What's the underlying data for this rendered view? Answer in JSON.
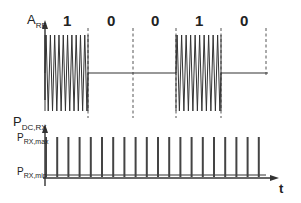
{
  "diagram": {
    "top_axis_label": {
      "main": "A",
      "sub": "RF"
    },
    "bottom_axis_label": {
      "main": "P",
      "sub": "DC,RX"
    },
    "level_max": {
      "main": "P",
      "sub": "RX,max"
    },
    "level_min": {
      "main": "P",
      "sub": "RX,min"
    },
    "time_axis_label": "t",
    "bits": [
      "1",
      "0",
      "0",
      "1",
      "0"
    ],
    "bit_boundaries_x": [
      45,
      88,
      133,
      176,
      221,
      266
    ],
    "burst_bits": [
      true,
      false,
      false,
      true,
      false
    ],
    "pulse_count": 20,
    "colors": {
      "line": "#333333",
      "dash": "#555555",
      "text": "#222222"
    }
  }
}
